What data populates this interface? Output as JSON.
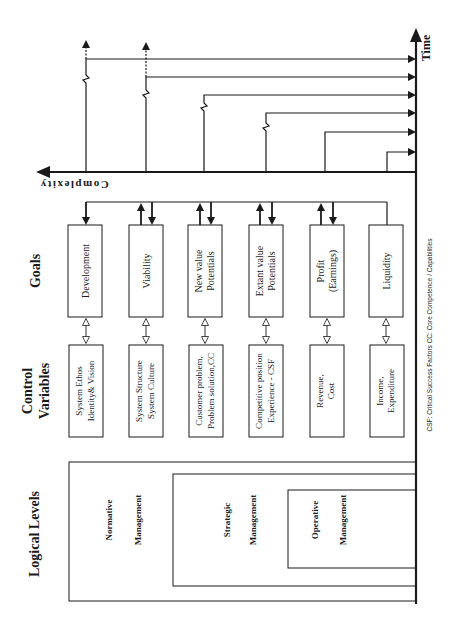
{
  "axes": {
    "time_label": "Time",
    "complexity_label": "Complexity"
  },
  "row_headers": {
    "goals": "Goals",
    "control_variables_line1": "Control",
    "control_variables_line2": "Variables",
    "logical_levels": "Logical Levels"
  },
  "goals": [
    {
      "line1": "Development",
      "line2": ""
    },
    {
      "line1": "Viability",
      "line2": ""
    },
    {
      "line1": "New value",
      "line2": "Potentials"
    },
    {
      "line1": "Extant value",
      "line2": "Potentials"
    },
    {
      "line1": "Profit",
      "line2": "(Earnings)"
    },
    {
      "line1": "Liquidity",
      "line2": ""
    }
  ],
  "control_variables": [
    {
      "line1": "System Ethos",
      "line2": "Identity& Vision"
    },
    {
      "line1": "System Structure",
      "line2": "System Culture"
    },
    {
      "line1": "Customer problem,",
      "line2": "Problem solution,CC"
    },
    {
      "line1": "Competitive position",
      "line2": "Experience - CSF"
    },
    {
      "line1": "Revenue,",
      "line2": "Cost"
    },
    {
      "line1": "Income,",
      "line2": "Expenditure"
    }
  ],
  "logical_levels": [
    {
      "line1": "Normative",
      "line2": "Management"
    },
    {
      "line1": "Strategic",
      "line2": "Management"
    },
    {
      "line1": "Operative",
      "line2": "Management"
    }
  ],
  "footnote": "CSF: Critical Success Factors  CC: Core Competence / Capabilities",
  "colors": {
    "line": "#1a1a1a",
    "background": "#ffffff"
  }
}
